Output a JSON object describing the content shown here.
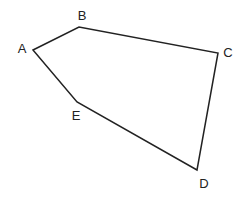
{
  "diagram": {
    "type": "pentagon",
    "stroke_color": "#222222",
    "vertices": [
      {
        "label": "A",
        "x": 33,
        "y": 50,
        "lx": 22,
        "ly": 53
      },
      {
        "label": "B",
        "x": 79,
        "y": 27,
        "lx": 82,
        "ly": 20
      },
      {
        "label": "C",
        "x": 218,
        "y": 53,
        "lx": 228,
        "ly": 57
      },
      {
        "label": "D",
        "x": 197,
        "y": 170,
        "lx": 204,
        "ly": 188
      },
      {
        "label": "E",
        "x": 77,
        "y": 102,
        "lx": 76,
        "ly": 120
      }
    ]
  }
}
